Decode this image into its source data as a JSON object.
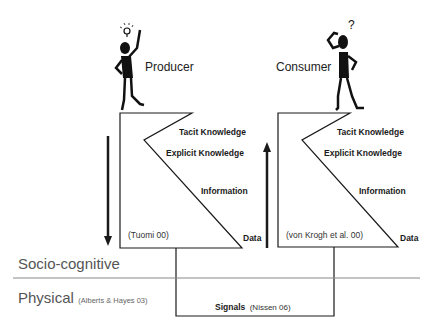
{
  "producer": {
    "label": "Producer",
    "levels": [
      "Tacit Knowledge",
      "Explicit Knowledge",
      "Information",
      "Data"
    ],
    "citation": "(Tuomi 00)",
    "arrow_direction": "down",
    "figure_icon": "idea-lightbulb"
  },
  "consumer": {
    "label": "Consumer",
    "levels": [
      "Tacit Knowledge",
      "Explicit Knowledge",
      "Information",
      "Data"
    ],
    "citation": "(von Krogh et al. 00)",
    "arrow_direction": "up",
    "figure_icon": "question-mark"
  },
  "layers": {
    "socio": "Socio-cognitive",
    "physical": "Physical",
    "physical_citation": "(Alberts & Hayes 03)"
  },
  "signals": {
    "label": "Signals",
    "citation": "(Nissen 06)"
  },
  "colors": {
    "line": "#1a1a1a",
    "divider": "#888888",
    "layer_text": "#555555"
  }
}
